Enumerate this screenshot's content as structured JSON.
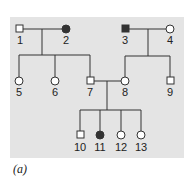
{
  "caption": "(a)",
  "colors": {
    "panel": "#e4e4e4",
    "line": "#333333",
    "affected": "#333333",
    "unaffected": "#ffffff"
  },
  "individuals": [
    {
      "id": "1",
      "sex": "male",
      "affected": false,
      "generation": 1
    },
    {
      "id": "2",
      "sex": "female",
      "affected": true,
      "generation": 1
    },
    {
      "id": "3",
      "sex": "male",
      "affected": true,
      "generation": 1
    },
    {
      "id": "4",
      "sex": "female",
      "affected": false,
      "generation": 1
    },
    {
      "id": "5",
      "sex": "female",
      "affected": false,
      "generation": 2
    },
    {
      "id": "6",
      "sex": "female",
      "affected": false,
      "generation": 2
    },
    {
      "id": "7",
      "sex": "male",
      "affected": false,
      "generation": 2
    },
    {
      "id": "8",
      "sex": "female",
      "affected": false,
      "generation": 2
    },
    {
      "id": "9",
      "sex": "male",
      "affected": false,
      "generation": 2
    },
    {
      "id": "10",
      "sex": "male",
      "affected": false,
      "generation": 3
    },
    {
      "id": "11",
      "sex": "female",
      "affected": true,
      "generation": 3
    },
    {
      "id": "12",
      "sex": "female",
      "affected": false,
      "generation": 3
    },
    {
      "id": "13",
      "sex": "female",
      "affected": false,
      "generation": 3
    }
  ],
  "labels": {
    "l1": "1",
    "l2": "2",
    "l3": "3",
    "l4": "4",
    "l5": "5",
    "l6": "6",
    "l7": "7",
    "l8": "8",
    "l9": "9",
    "l10": "10",
    "l11": "11",
    "l12": "12",
    "l13": "13"
  }
}
